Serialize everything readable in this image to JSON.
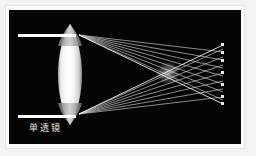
{
  "figure": {
    "title": "单透镜",
    "caption": "单透镜",
    "caption_translation": "single lens",
    "panel_background": "#050505",
    "mat_background": "#fbfbfa",
    "page_background": "#f3f3f1",
    "panel": {
      "x": 9,
      "y": 10,
      "width": 232,
      "height": 134
    }
  },
  "optics": {
    "element_name": "biconvex-lens",
    "lens": {
      "center_x": 61,
      "top_apex_y": 14,
      "bottom_apex_y": 115,
      "half_width": 16,
      "color_bright": "#ffffff",
      "color_edge": "#8f8f8f"
    },
    "aperture_bars": [
      {
        "name": "upper-aperture-bar",
        "x": 9,
        "y": 24,
        "width": 58,
        "height": 3,
        "color": "#ffffff"
      },
      {
        "name": "lower-aperture-bar",
        "x": 9,
        "y": 105,
        "width": 58,
        "height": 3,
        "color": "#ffffff"
      }
    ],
    "crossover": {
      "x": 159,
      "y": 63
    },
    "ray_color": "#d8d8d8",
    "ray_count_upper": 7,
    "ray_count_lower": 7,
    "upper_fan_origin": {
      "x": 70,
      "y": 24
    },
    "lower_fan_origin": {
      "x": 70,
      "y": 105
    },
    "ray_end_x": 214
  }
}
